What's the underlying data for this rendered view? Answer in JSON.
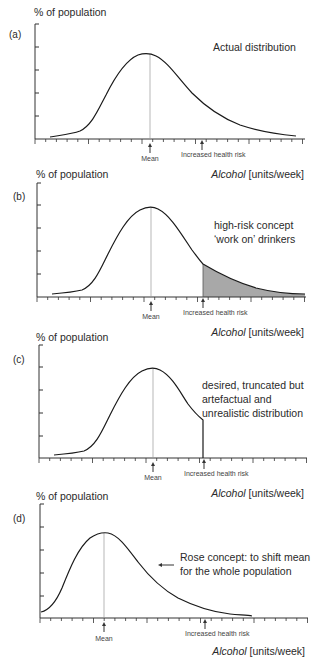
{
  "figure": {
    "y_axis_label": "% of population",
    "x_axis_label_italic": "Alcohol",
    "x_axis_label_units": " [units/week]",
    "mean_label": "Mean",
    "risk_label": "Increased health risk"
  },
  "panels": [
    {
      "id": "a",
      "tag": "(a)",
      "annotation": [
        "Actual distribution"
      ]
    },
    {
      "id": "b",
      "tag": "(b)",
      "annotation": [
        "high-risk concept",
        "‘work on’ drinkers"
      ]
    },
    {
      "id": "c",
      "tag": "(c)",
      "annotation": [
        "desired, truncated but",
        "artefactual and",
        "unrealistic distribution"
      ]
    },
    {
      "id": "d",
      "tag": "(d)",
      "annotation": [
        "Rose concept: to shift mean",
        "for the whole population"
      ]
    }
  ],
  "colors": {
    "curve": "#1a1a1a",
    "shade": "#a8a8a8",
    "mean_line": "#999999",
    "axis": "#333333"
  },
  "chart_data": [
    {
      "type": "line",
      "title": "(a) Actual distribution",
      "xlabel": "Alcohol [units/week]",
      "ylabel": "% of population",
      "x_tick_labels": [],
      "y_tick_labels": [],
      "grid": false,
      "markers": {
        "mean_x": 10.6,
        "increased_health_risk_x": 15.5
      },
      "series": [
        {
          "name": "Actual distribution",
          "x": [
            1,
            2,
            3,
            4,
            5,
            6,
            7,
            8,
            9,
            10,
            10.6,
            11,
            12,
            13,
            14,
            15,
            16,
            17,
            18,
            19,
            20,
            21,
            22,
            23,
            24,
            24.6
          ],
          "values": [
            0.3,
            0.5,
            0.8,
            1.2,
            2.0,
            3.5,
            5.5,
            7.2,
            8.4,
            8.9,
            9.0,
            8.9,
            8.2,
            7.0,
            5.8,
            4.7,
            3.8,
            3.0,
            2.3,
            1.7,
            1.2,
            0.8,
            0.6,
            0.4,
            0.25,
            0.2
          ]
        }
      ]
    },
    {
      "type": "area",
      "title": "(b) high-risk concept 'work on' drinkers",
      "xlabel": "Alcohol [units/week]",
      "ylabel": "% of population",
      "x_tick_labels": [],
      "y_tick_labels": [],
      "grid": false,
      "markers": {
        "mean_x": 10.6,
        "increased_health_risk_x": 15.5
      },
      "shaded_region": {
        "x_from": 15.5,
        "x_to": 25,
        "meaning": "high-risk drinkers targeted"
      },
      "series": [
        {
          "name": "Distribution",
          "x": [
            1,
            2,
            3,
            4,
            5,
            6,
            7,
            8,
            9,
            10,
            10.6,
            11,
            12,
            13,
            14,
            15,
            15.5,
            16,
            17,
            18,
            19,
            20,
            21,
            22,
            23,
            24,
            25
          ],
          "values": [
            0.3,
            0.5,
            0.8,
            1.2,
            2.0,
            3.5,
            5.5,
            7.2,
            8.4,
            8.9,
            9.0,
            8.9,
            8.2,
            7.0,
            5.8,
            4.7,
            4.2,
            3.8,
            3.0,
            2.3,
            1.7,
            1.2,
            0.8,
            0.6,
            0.45,
            0.35,
            0.3
          ]
        }
      ]
    },
    {
      "type": "line",
      "title": "(c) desired, truncated but artefactual and unrealistic distribution",
      "xlabel": "Alcohol [units/week]",
      "ylabel": "% of population",
      "x_tick_labels": [],
      "y_tick_labels": [],
      "grid": false,
      "markers": {
        "mean_x": 10.6,
        "increased_health_risk_x": 15.5
      },
      "series": [
        {
          "name": "Truncated distribution",
          "x": [
            1,
            2,
            3,
            4,
            5,
            6,
            7,
            8,
            9,
            10,
            10.6,
            11,
            12,
            13,
            14,
            15,
            15.5,
            15.5
          ],
          "values": [
            0.3,
            0.5,
            0.8,
            1.2,
            2.0,
            3.5,
            5.5,
            7.2,
            8.4,
            8.9,
            9.0,
            8.9,
            8.2,
            7.0,
            5.8,
            4.7,
            4.2,
            0
          ]
        }
      ]
    },
    {
      "type": "line",
      "title": "(d) Rose concept: to shift mean for the whole population",
      "xlabel": "Alcohol [units/week]",
      "ylabel": "% of population",
      "x_tick_labels": [],
      "y_tick_labels": [],
      "grid": false,
      "markers": {
        "mean_x": 6.0,
        "increased_health_risk_x": 15.5,
        "arrow_direction": "left"
      },
      "series": [
        {
          "name": "Shifted distribution",
          "x": [
            0,
            1,
            2,
            3,
            4,
            5,
            6,
            7,
            8,
            9,
            10,
            11,
            12,
            13,
            14,
            15,
            16,
            17,
            18,
            19,
            20
          ],
          "values": [
            0.7,
            1.5,
            3.0,
            5.0,
            7.0,
            8.4,
            9.0,
            8.8,
            8.0,
            6.7,
            5.3,
            4.1,
            3.1,
            2.3,
            1.6,
            1.1,
            0.7,
            0.45,
            0.3,
            0.2,
            0.15
          ]
        }
      ]
    }
  ]
}
